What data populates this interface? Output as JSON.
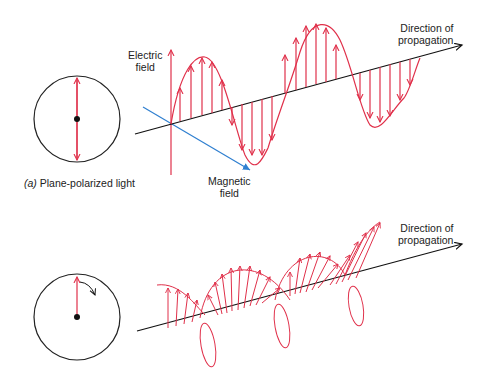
{
  "colors": {
    "wave": "#e0304a",
    "axis": "#111111",
    "magnetic": "#2f7fd0",
    "circle": "#222222"
  },
  "panel_a": {
    "caption_prefix": "(a)",
    "caption_text": "Plane-polarized light",
    "electric_label_1": "Electric",
    "electric_label_2": "field",
    "magnetic_label_1": "Magnetic",
    "magnetic_label_2": "field",
    "direction_label_1": "Direction of",
    "direction_label_2": "propagation"
  },
  "panel_b": {
    "direction_label_1": "Direction of",
    "direction_label_2": "propagation"
  }
}
